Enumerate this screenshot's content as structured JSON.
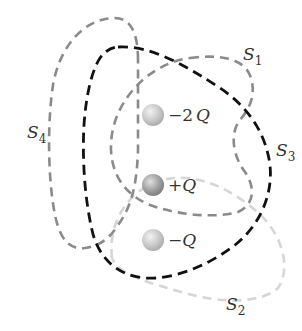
{
  "figure": {
    "colors": {
      "background": "#ffffff",
      "s1": "#8a8a8a",
      "s2": "#d6d6d6",
      "s3": "#111111",
      "s4": "#8a8a8a",
      "charge_fill": "#bdbdbd",
      "charge_plus": "#9a9a9a"
    }
  },
  "surfaces": [
    {
      "id": "S1",
      "letter": "S",
      "subscript": "1",
      "color": "#8a8a8a"
    },
    {
      "id": "S2",
      "letter": "S",
      "subscript": "2",
      "color": "#d6d6d6"
    },
    {
      "id": "S3",
      "letter": "S",
      "subscript": "3",
      "color": "#111111"
    },
    {
      "id": "S4",
      "letter": "S",
      "subscript": "4",
      "color": "#8a8a8a"
    }
  ],
  "charges": [
    {
      "sign": "−",
      "magnitude": "2",
      "symbol": "Q",
      "label": "−2Q"
    },
    {
      "sign": "+",
      "magnitude": "",
      "symbol": "Q",
      "label": "+Q"
    },
    {
      "sign": "−",
      "magnitude": "",
      "symbol": "Q",
      "label": "−Q"
    }
  ]
}
